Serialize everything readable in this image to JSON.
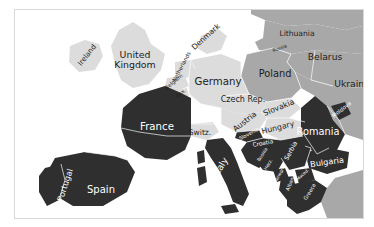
{
  "figure": {
    "type": "map",
    "region": "Europe",
    "projection_note": "political map of Europe with three-tone country shading"
  },
  "legend_tones": {
    "dark_fill": "#2f2f2f",
    "light_fill": "#dcdcdc",
    "medium_fill": "#a8a8a8",
    "sea_fill": "#ffffff",
    "border_stroke": "#ffffff",
    "frame_stroke": "#d8d8d8",
    "page_background": "#ffffff",
    "dark_label_color": "#ffffff",
    "light_label_color": "#1d1d1d"
  },
  "map_labels": [
    {
      "name": "Ireland",
      "text": "Ireland",
      "tone": "light",
      "x": 72,
      "y": 45,
      "size": 7.2,
      "rotate": -52
    },
    {
      "name": "United Kingdom",
      "text": "United\nKingdom",
      "tone": "light",
      "x": 120,
      "y": 50,
      "size": 9.4,
      "rotate": 0
    },
    {
      "name": "Denmark",
      "text": "Denmark",
      "tone": "light",
      "x": 191,
      "y": 27,
      "size": 7.6,
      "rotate": -42
    },
    {
      "name": "Netherlands",
      "text": "Netherlands",
      "tone": "light",
      "x": 167,
      "y": 57,
      "size": 5.4,
      "rotate": -62
    },
    {
      "name": "Belgium",
      "text": "Belgium",
      "tone": "light",
      "x": 159,
      "y": 72,
      "size": 5.2,
      "rotate": -40
    },
    {
      "name": "Luxembourg",
      "text": "Lux.",
      "tone": "light",
      "x": 166,
      "y": 83,
      "size": 5.0,
      "rotate": -36
    },
    {
      "name": "Germany",
      "text": "Germany",
      "tone": "light",
      "x": 203,
      "y": 72,
      "size": 10.2,
      "rotate": 0
    },
    {
      "name": "Poland",
      "text": "Poland",
      "tone": "light",
      "x": 260,
      "y": 64,
      "size": 9.8,
      "rotate": 0
    },
    {
      "name": "Lithuania",
      "text": "Lithuania",
      "tone": "light",
      "x": 282,
      "y": 24,
      "size": 7.6,
      "rotate": 0
    },
    {
      "name": "Russia",
      "text": "Russia",
      "tone": "light",
      "x": 265,
      "y": 39,
      "size": 4.6,
      "rotate": -20
    },
    {
      "name": "Belarus",
      "text": "Belarus",
      "tone": "light",
      "x": 310,
      "y": 47,
      "size": 9.2,
      "rotate": 0
    },
    {
      "name": "Ukraine",
      "text": "Ukraine",
      "tone": "light",
      "x": 337,
      "y": 74,
      "size": 9.2,
      "rotate": 0
    },
    {
      "name": "Czech Republic",
      "text": "Czech Rep.",
      "tone": "light",
      "x": 228,
      "y": 90,
      "size": 8.0,
      "rotate": 0
    },
    {
      "name": "Slovakia",
      "text": "Slovakia",
      "tone": "light",
      "x": 264,
      "y": 98,
      "size": 7.8,
      "rotate": -22
    },
    {
      "name": "Austria",
      "text": "Austria",
      "tone": "light",
      "x": 230,
      "y": 112,
      "size": 7.8,
      "rotate": -38
    },
    {
      "name": "Hungary",
      "text": "Hungary",
      "tone": "light",
      "x": 263,
      "y": 118,
      "size": 7.8,
      "rotate": -14
    },
    {
      "name": "Switzerland",
      "text": "Switz.",
      "tone": "light",
      "x": 185,
      "y": 123,
      "size": 7.6,
      "rotate": 0
    },
    {
      "name": "Slovenia",
      "text": "Slovenia",
      "tone": "dark",
      "x": 234,
      "y": 124,
      "size": 5.0,
      "rotate": -28
    },
    {
      "name": "Croatia",
      "text": "Croatia",
      "tone": "dark",
      "x": 248,
      "y": 134,
      "size": 5.8,
      "rotate": -10
    },
    {
      "name": "Bosnia and Herzegovina",
      "text": "Bosnia",
      "tone": "dark",
      "x": 248,
      "y": 145,
      "size": 4.6,
      "rotate": -58
    },
    {
      "name": "Herzegovina",
      "text": "Herz.",
      "tone": "dark",
      "x": 254,
      "y": 155,
      "size": 4.6,
      "rotate": -58
    },
    {
      "name": "Serbia",
      "text": "Serbia",
      "tone": "dark",
      "x": 276,
      "y": 141,
      "size": 6.4,
      "rotate": -62
    },
    {
      "name": "Montenegro",
      "text": "Montenegro",
      "tone": "dark",
      "x": 263,
      "y": 168,
      "size": 4.2,
      "rotate": -62
    },
    {
      "name": "Albania",
      "text": "Albania",
      "tone": "dark",
      "x": 276,
      "y": 172,
      "size": 5.0,
      "rotate": -68
    },
    {
      "name": "Macedonia",
      "text": "Maced.",
      "tone": "dark",
      "x": 288,
      "y": 165,
      "size": 4.2,
      "rotate": -42
    },
    {
      "name": "Greece",
      "text": "Greece",
      "tone": "dark",
      "x": 295,
      "y": 182,
      "size": 5.2,
      "rotate": -58
    },
    {
      "name": "Romania",
      "text": "Romania",
      "tone": "dark",
      "x": 303,
      "y": 122,
      "size": 9.8,
      "rotate": 0
    },
    {
      "name": "Moldova",
      "text": "Moldova",
      "tone": "dark",
      "x": 327,
      "y": 100,
      "size": 5.4,
      "rotate": -38
    },
    {
      "name": "Bulgaria",
      "text": "Bulgaria",
      "tone": "dark",
      "x": 312,
      "y": 152,
      "size": 8.2,
      "rotate": -8
    },
    {
      "name": "Italy",
      "text": "Italy",
      "tone": "dark",
      "x": 206,
      "y": 157,
      "size": 9.0,
      "rotate": -58
    },
    {
      "name": "France",
      "text": "France",
      "tone": "dark",
      "x": 142,
      "y": 117,
      "size": 10.2,
      "rotate": 0
    },
    {
      "name": "Spain",
      "text": "Spain",
      "tone": "dark",
      "x": 86,
      "y": 180,
      "size": 10.0,
      "rotate": 0
    },
    {
      "name": "Portugal",
      "text": "Portugal",
      "tone": "dark",
      "x": 50,
      "y": 175,
      "size": 8.2,
      "rotate": -72
    }
  ]
}
